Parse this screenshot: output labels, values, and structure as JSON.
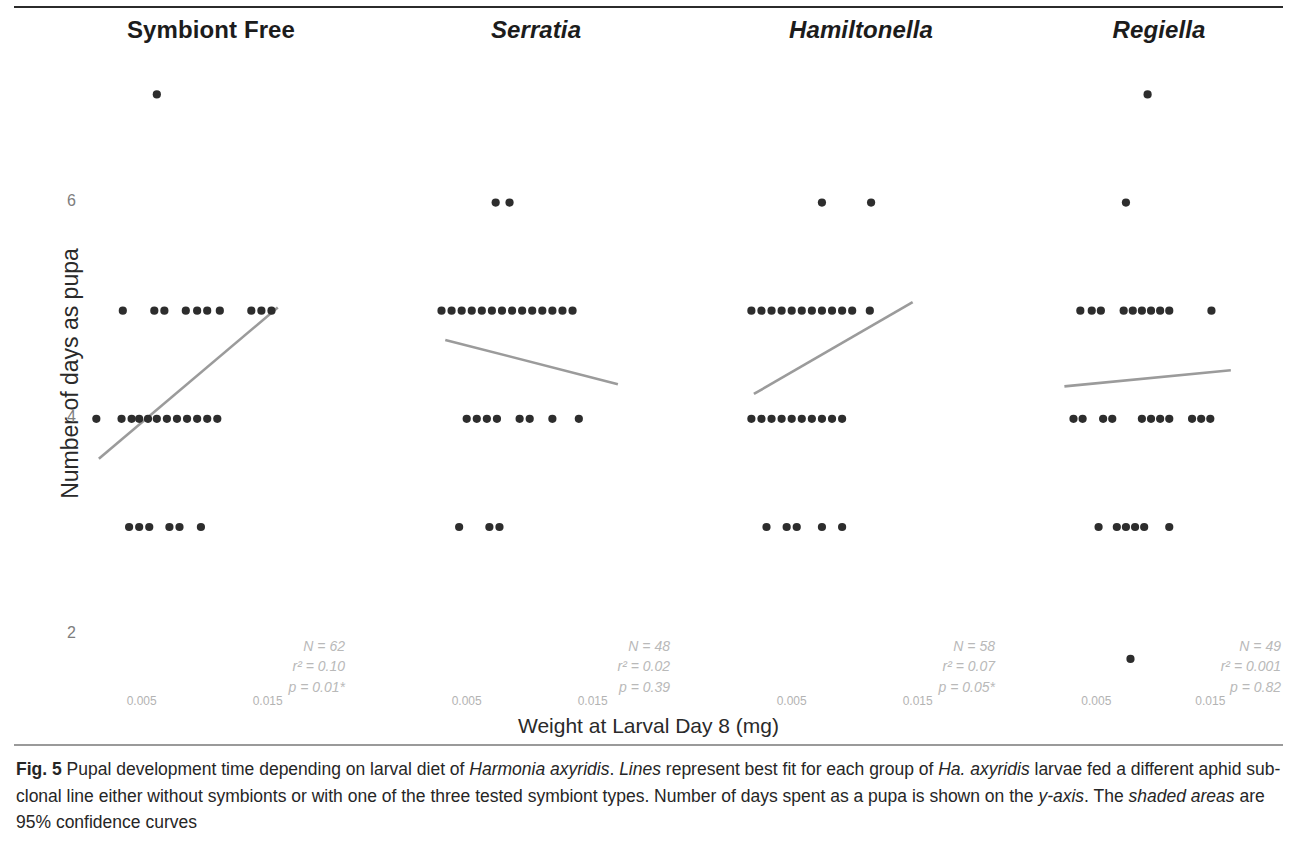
{
  "figure": {
    "label": "Fig. 5",
    "xlabel": "Weight at Larval Day 8 (mg)",
    "ylabel": "Number of days as pupa",
    "caption_parts": {
      "p1": " Pupal development time depending on larval diet of ",
      "i1": "Harmonia axyridis",
      "p2": ". ",
      "i2": "Lines",
      "p3": " represent best fit for each group of ",
      "i3": "Ha. axyridis",
      "p4": " larvae fed a different aphid sub-clonal line either without symbionts or with one of the three tested symbiont types. Number of days spent as a pupa is shown on the ",
      "i4": "y-axis",
      "p5": ". The ",
      "i5": "shaded areas",
      "p6": " are 95% confidence curves"
    }
  },
  "chart_data": {
    "type": "scatter",
    "title": "Pupal development time depending on larval diet of Harmonia axyridis",
    "xlabel": "Weight at Larval Day 8 (mg)",
    "ylabel": "Number of days as pupa",
    "grid": false,
    "legend": "none",
    "ylim": [
      1.4,
      7.3
    ],
    "yticks": [
      2,
      4,
      6
    ],
    "ytick_labels": [
      "2",
      "4",
      "6"
    ],
    "xlim": [
      0.0005,
      0.0205
    ],
    "xticks": [
      0.005,
      0.015
    ],
    "xtick_labels": [
      "0.005",
      "0.015"
    ],
    "marker_color": "#2d2d2d",
    "line_color": "#9b9b9b",
    "panels": [
      {
        "name": "Symbiont Free",
        "italic": false,
        "stats": {
          "N": "N = 62",
          "r2": "r² = 0.10",
          "p": "p = 0.01*"
        },
        "fit_line": {
          "x0": 0.0016,
          "y0": 3.63,
          "x1": 0.0158,
          "y1": 5.03
        },
        "points": [
          {
            "x": 0.0062,
            "y": 7.0
          },
          {
            "x": 0.0035,
            "y": 5.0
          },
          {
            "x": 0.006,
            "y": 5.0
          },
          {
            "x": 0.0068,
            "y": 5.0
          },
          {
            "x": 0.0085,
            "y": 5.0
          },
          {
            "x": 0.0094,
            "y": 5.0
          },
          {
            "x": 0.0102,
            "y": 5.0
          },
          {
            "x": 0.0112,
            "y": 5.0
          },
          {
            "x": 0.0137,
            "y": 5.0
          },
          {
            "x": 0.0145,
            "y": 5.0
          },
          {
            "x": 0.0153,
            "y": 5.0
          },
          {
            "x": 0.0014,
            "y": 4.0
          },
          {
            "x": 0.0034,
            "y": 4.0
          },
          {
            "x": 0.0042,
            "y": 4.0
          },
          {
            "x": 0.0048,
            "y": 4.0
          },
          {
            "x": 0.0055,
            "y": 4.0
          },
          {
            "x": 0.0062,
            "y": 4.0
          },
          {
            "x": 0.007,
            "y": 4.0
          },
          {
            "x": 0.0078,
            "y": 4.0
          },
          {
            "x": 0.0086,
            "y": 4.0
          },
          {
            "x": 0.0094,
            "y": 4.0
          },
          {
            "x": 0.0102,
            "y": 4.0
          },
          {
            "x": 0.011,
            "y": 4.0
          },
          {
            "x": 0.004,
            "y": 3.0
          },
          {
            "x": 0.0048,
            "y": 3.0
          },
          {
            "x": 0.0056,
            "y": 3.0
          },
          {
            "x": 0.0072,
            "y": 3.0
          },
          {
            "x": 0.008,
            "y": 3.0
          },
          {
            "x": 0.0097,
            "y": 3.0
          }
        ]
      },
      {
        "name": "Serratia",
        "italic": true,
        "stats": {
          "N": "N = 48",
          "r²": "r² = 0.02",
          "r2": "r² = 0.02",
          "p": "p = 0.39"
        },
        "fit_line": {
          "x0": 0.0033,
          "y0": 4.73,
          "x1": 0.017,
          "y1": 4.32
        },
        "points": [
          {
            "x": 0.0073,
            "y": 6.0
          },
          {
            "x": 0.0084,
            "y": 6.0
          },
          {
            "x": 0.003,
            "y": 5.0
          },
          {
            "x": 0.0038,
            "y": 5.0
          },
          {
            "x": 0.0046,
            "y": 5.0
          },
          {
            "x": 0.0054,
            "y": 5.0
          },
          {
            "x": 0.0062,
            "y": 5.0
          },
          {
            "x": 0.007,
            "y": 5.0
          },
          {
            "x": 0.0078,
            "y": 5.0
          },
          {
            "x": 0.0086,
            "y": 5.0
          },
          {
            "x": 0.0094,
            "y": 5.0
          },
          {
            "x": 0.0102,
            "y": 5.0
          },
          {
            "x": 0.011,
            "y": 5.0
          },
          {
            "x": 0.0118,
            "y": 5.0
          },
          {
            "x": 0.0126,
            "y": 5.0
          },
          {
            "x": 0.0134,
            "y": 5.0
          },
          {
            "x": 0.005,
            "y": 4.0
          },
          {
            "x": 0.0058,
            "y": 4.0
          },
          {
            "x": 0.0066,
            "y": 4.0
          },
          {
            "x": 0.0074,
            "y": 4.0
          },
          {
            "x": 0.0092,
            "y": 4.0
          },
          {
            "x": 0.01,
            "y": 4.0
          },
          {
            "x": 0.0118,
            "y": 4.0
          },
          {
            "x": 0.0139,
            "y": 4.0
          },
          {
            "x": 0.0044,
            "y": 3.0
          },
          {
            "x": 0.0068,
            "y": 3.0
          },
          {
            "x": 0.0076,
            "y": 3.0
          }
        ]
      },
      {
        "name": "Hamiltonella",
        "italic": true,
        "stats": {
          "N": "N = 58",
          "r2": "r² = 0.07",
          "p": "p = 0.05*"
        },
        "fit_line": {
          "x0": 0.002,
          "y0": 4.23,
          "x1": 0.0146,
          "y1": 5.08
        },
        "points": [
          {
            "x": 0.0074,
            "y": 6.0
          },
          {
            "x": 0.0113,
            "y": 6.0
          },
          {
            "x": 0.0018,
            "y": 5.0
          },
          {
            "x": 0.0026,
            "y": 5.0
          },
          {
            "x": 0.0034,
            "y": 5.0
          },
          {
            "x": 0.0042,
            "y": 5.0
          },
          {
            "x": 0.005,
            "y": 5.0
          },
          {
            "x": 0.0058,
            "y": 5.0
          },
          {
            "x": 0.0066,
            "y": 5.0
          },
          {
            "x": 0.0074,
            "y": 5.0
          },
          {
            "x": 0.0082,
            "y": 5.0
          },
          {
            "x": 0.009,
            "y": 5.0
          },
          {
            "x": 0.0098,
            "y": 5.0
          },
          {
            "x": 0.0112,
            "y": 5.0
          },
          {
            "x": 0.0018,
            "y": 4.0
          },
          {
            "x": 0.0026,
            "y": 4.0
          },
          {
            "x": 0.0034,
            "y": 4.0
          },
          {
            "x": 0.0042,
            "y": 4.0
          },
          {
            "x": 0.005,
            "y": 4.0
          },
          {
            "x": 0.0058,
            "y": 4.0
          },
          {
            "x": 0.0066,
            "y": 4.0
          },
          {
            "x": 0.0074,
            "y": 4.0
          },
          {
            "x": 0.0082,
            "y": 4.0
          },
          {
            "x": 0.009,
            "y": 4.0
          },
          {
            "x": 0.003,
            "y": 3.0
          },
          {
            "x": 0.0046,
            "y": 3.0
          },
          {
            "x": 0.0054,
            "y": 3.0
          },
          {
            "x": 0.0074,
            "y": 3.0
          },
          {
            "x": 0.009,
            "y": 3.0
          }
        ]
      },
      {
        "name": "Regiella",
        "italic": true,
        "stats": {
          "N": "N = 49",
          "r2": "r² = 0.001",
          "p": "p = 0.82"
        },
        "fit_line": {
          "x0": 0.0022,
          "y0": 4.3,
          "x1": 0.0168,
          "y1": 4.45
        },
        "points": [
          {
            "x": 0.0095,
            "y": 7.0
          },
          {
            "x": 0.0076,
            "y": 6.0
          },
          {
            "x": 0.0036,
            "y": 5.0
          },
          {
            "x": 0.0046,
            "y": 5.0
          },
          {
            "x": 0.0054,
            "y": 5.0
          },
          {
            "x": 0.0074,
            "y": 5.0
          },
          {
            "x": 0.0082,
            "y": 5.0
          },
          {
            "x": 0.009,
            "y": 5.0
          },
          {
            "x": 0.0098,
            "y": 5.0
          },
          {
            "x": 0.0106,
            "y": 5.0
          },
          {
            "x": 0.0114,
            "y": 5.0
          },
          {
            "x": 0.0151,
            "y": 5.0
          },
          {
            "x": 0.003,
            "y": 4.0
          },
          {
            "x": 0.0038,
            "y": 4.0
          },
          {
            "x": 0.0056,
            "y": 4.0
          },
          {
            "x": 0.0064,
            "y": 4.0
          },
          {
            "x": 0.009,
            "y": 4.0
          },
          {
            "x": 0.0098,
            "y": 4.0
          },
          {
            "x": 0.0106,
            "y": 4.0
          },
          {
            "x": 0.0114,
            "y": 4.0
          },
          {
            "x": 0.0134,
            "y": 4.0
          },
          {
            "x": 0.0142,
            "y": 4.0
          },
          {
            "x": 0.015,
            "y": 4.0
          },
          {
            "x": 0.0052,
            "y": 3.0
          },
          {
            "x": 0.0068,
            "y": 3.0
          },
          {
            "x": 0.0076,
            "y": 3.0
          },
          {
            "x": 0.0084,
            "y": 3.0
          },
          {
            "x": 0.0092,
            "y": 3.0
          },
          {
            "x": 0.0114,
            "y": 3.0
          },
          {
            "x": 0.008,
            "y": 1.78
          }
        ]
      }
    ]
  }
}
